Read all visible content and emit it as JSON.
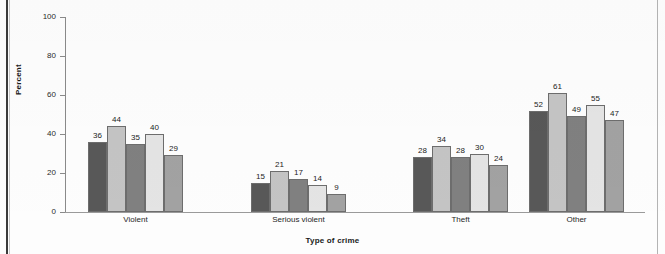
{
  "chart_data": {
    "type": "bar",
    "title": "",
    "xlabel": "Type of crime",
    "ylabel": "Percent",
    "categories": [
      "Violent",
      "Serious violent",
      "Theft",
      "Other"
    ],
    "series": [
      {
        "name": "series-1",
        "color": "#585858",
        "values": [
          36,
          15,
          28,
          52
        ]
      },
      {
        "name": "series-2",
        "color": "#c4c4c4",
        "values": [
          44,
          21,
          34,
          61
        ]
      },
      {
        "name": "series-3",
        "color": "#808080",
        "values": [
          35,
          17,
          28,
          49
        ]
      },
      {
        "name": "series-4",
        "color": "#e4e4e4",
        "values": [
          40,
          14,
          30,
          55
        ]
      },
      {
        "name": "series-5",
        "color": "#a2a2a2",
        "values": [
          29,
          9,
          24,
          47
        ]
      }
    ],
    "ylim": [
      0,
      100
    ],
    "yticks": [
      0,
      20,
      40,
      60,
      80,
      100
    ],
    "ytick_labels": [
      "0",
      "20",
      "40",
      "60",
      "80",
      "100"
    ],
    "grid": false,
    "legend": "none",
    "bar_label_format": "integer"
  },
  "axes": {
    "y_tick_labels": [
      "100",
      "80",
      "60",
      "40",
      "20",
      "0"
    ],
    "y_axis_title": "Percent",
    "x_axis_title": "Type of crime"
  },
  "groups": [
    {
      "label": "Violent",
      "bars": [
        {
          "value": "36",
          "pct": 36,
          "color": "#585858"
        },
        {
          "value": "44",
          "pct": 44,
          "color": "#c4c4c4"
        },
        {
          "value": "35",
          "pct": 35,
          "color": "#808080"
        },
        {
          "value": "40",
          "pct": 40,
          "color": "#e4e4e4"
        },
        {
          "value": "29",
          "pct": 29,
          "color": "#a2a2a2"
        }
      ]
    },
    {
      "label": "Serious violent",
      "bars": [
        {
          "value": "15",
          "pct": 15,
          "color": "#585858"
        },
        {
          "value": "21",
          "pct": 21,
          "color": "#c4c4c4"
        },
        {
          "value": "17",
          "pct": 17,
          "color": "#808080"
        },
        {
          "value": "14",
          "pct": 14,
          "color": "#e4e4e4"
        },
        {
          "value": "9",
          "pct": 9,
          "color": "#a2a2a2"
        }
      ]
    },
    {
      "label": "Theft",
      "bars": [
        {
          "value": "28",
          "pct": 28,
          "color": "#585858"
        },
        {
          "value": "34",
          "pct": 34,
          "color": "#c4c4c4"
        },
        {
          "value": "28",
          "pct": 28,
          "color": "#808080"
        },
        {
          "value": "30",
          "pct": 30,
          "color": "#e4e4e4"
        },
        {
          "value": "24",
          "pct": 24,
          "color": "#a2a2a2"
        }
      ]
    },
    {
      "label": "Other",
      "bars": [
        {
          "value": "52",
          "pct": 52,
          "color": "#585858"
        },
        {
          "value": "61",
          "pct": 61,
          "color": "#c4c4c4"
        },
        {
          "value": "49",
          "pct": 49,
          "color": "#808080"
        },
        {
          "value": "55",
          "pct": 55,
          "color": "#e4e4e4"
        },
        {
          "value": "47",
          "pct": 47,
          "color": "#a2a2a2"
        }
      ]
    }
  ],
  "layout": {
    "group_left": [
      88,
      251,
      413,
      529
    ],
    "group_width": [
      95,
      95,
      95,
      95
    ]
  }
}
